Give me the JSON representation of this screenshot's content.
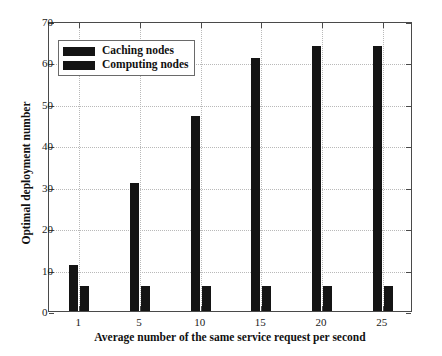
{
  "chart_data": {
    "type": "bar",
    "title": "",
    "xlabel": "Average number of the same service request per second",
    "ylabel": "Optimal deployment number",
    "categories": [
      "1",
      "5",
      "10",
      "15",
      "20",
      "25"
    ],
    "series": [
      {
        "name": "Caching nodes",
        "values": [
          11,
          31,
          47,
          61,
          64,
          64
        ]
      },
      {
        "name": "Computing nodes",
        "values": [
          6,
          6,
          6,
          6,
          6,
          6
        ]
      }
    ],
    "ylim": [
      0,
      70
    ],
    "yticks": [
      0,
      10,
      20,
      30,
      40,
      50,
      60,
      70
    ],
    "xticks": [
      "1",
      "5",
      "10",
      "15",
      "20",
      "25"
    ],
    "grid": true,
    "legend_position": "upper left",
    "bar_color": "#141414",
    "grid_color": "#b9b9b9",
    "axis_color": "#4a4a4a"
  },
  "legend": {
    "items": [
      {
        "label": "Caching nodes"
      },
      {
        "label": "Computing nodes"
      }
    ]
  }
}
